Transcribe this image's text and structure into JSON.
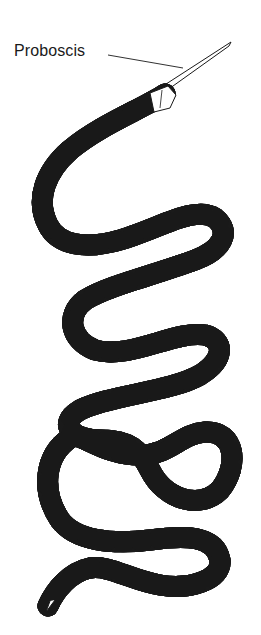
{
  "figure": {
    "labels": [
      {
        "id": "proboscis",
        "text": "Proboscis"
      }
    ],
    "colors": {
      "line": "#1a1a1a",
      "body_fill": "#ffffff",
      "stipple": "#333333",
      "background": "#ffffff"
    }
  }
}
